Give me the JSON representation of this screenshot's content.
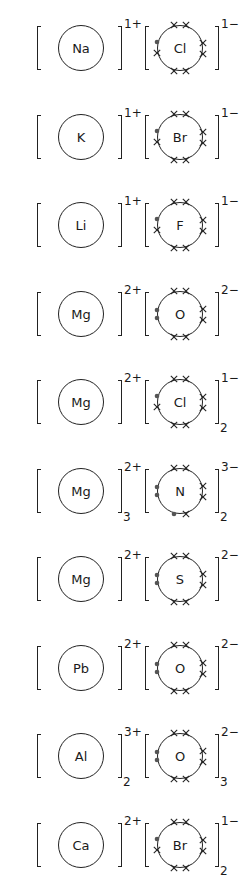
{
  "diagram": {
    "compounds": [
      {
        "name": "NaCl",
        "cation": {
          "symbol": "Na",
          "charge": "1+",
          "subscript": ""
        },
        "anion": {
          "symbol": "Cl",
          "charge": "1−",
          "subscript": "",
          "dots_left": 1,
          "dots_bottom": 0
        }
      },
      {
        "name": "KBr",
        "cation": {
          "symbol": "K",
          "charge": "1+",
          "subscript": ""
        },
        "anion": {
          "symbol": "Br",
          "charge": "1−",
          "subscript": "",
          "dots_left": 1,
          "dots_bottom": 0
        }
      },
      {
        "name": "LiF",
        "cation": {
          "symbol": "Li",
          "charge": "1+",
          "subscript": ""
        },
        "anion": {
          "symbol": "F",
          "charge": "1−",
          "subscript": "",
          "dots_left": 1,
          "dots_bottom": 0
        }
      },
      {
        "name": "MgO",
        "cation": {
          "symbol": "Mg",
          "charge": "2+",
          "subscript": ""
        },
        "anion": {
          "symbol": "O",
          "charge": "2−",
          "subscript": "",
          "dots_left": 2,
          "dots_bottom": 0
        }
      },
      {
        "name": "MgCl2",
        "cation": {
          "symbol": "Mg",
          "charge": "2+",
          "subscript": ""
        },
        "anion": {
          "symbol": "Cl",
          "charge": "1−",
          "subscript": "2",
          "dots_left": 1,
          "dots_bottom": 0
        }
      },
      {
        "name": "Mg3N2",
        "cation": {
          "symbol": "Mg",
          "charge": "2+",
          "subscript": "3"
        },
        "anion": {
          "symbol": "N",
          "charge": "3−",
          "subscript": "2",
          "dots_left": 2,
          "dots_bottom": 1
        }
      },
      {
        "name": "MgS",
        "cation": {
          "symbol": "Mg",
          "charge": "2+",
          "subscript": ""
        },
        "anion": {
          "symbol": "S",
          "charge": "2−",
          "subscript": "",
          "dots_left": 2,
          "dots_bottom": 0
        }
      },
      {
        "name": "PbO",
        "cation": {
          "symbol": "Pb",
          "charge": "2+",
          "subscript": ""
        },
        "anion": {
          "symbol": "O",
          "charge": "2−",
          "subscript": "",
          "dots_left": 2,
          "dots_bottom": 0
        }
      },
      {
        "name": "Al2O3",
        "cation": {
          "symbol": "Al",
          "charge": "3+",
          "subscript": "2"
        },
        "anion": {
          "symbol": "O",
          "charge": "2−",
          "subscript": "3",
          "dots_left": 2,
          "dots_bottom": 0
        }
      },
      {
        "name": "CaBr2",
        "cation": {
          "symbol": "Ca",
          "charge": "2+",
          "subscript": ""
        },
        "anion": {
          "symbol": "Br",
          "charge": "1−",
          "subscript": "2",
          "dots_left": 1,
          "dots_bottom": 0
        }
      }
    ]
  }
}
